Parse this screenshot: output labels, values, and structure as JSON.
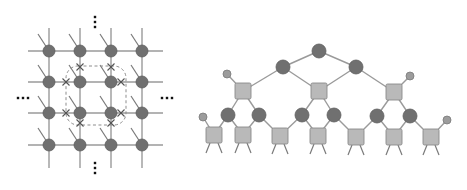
{
  "figure": {
    "width": 467,
    "height": 190,
    "background": "#ffffff"
  },
  "colors": {
    "edge": "#9a9a9a",
    "circle_node": "#707070",
    "small_node": "#9c9c9c",
    "square_node": "#b9b9b9",
    "dashed_loop": "#8d8d8d",
    "cross_marker": "#555555",
    "ellipsis": "#111111"
  },
  "left_panel": {
    "name": "2D tensor network lattice (PEPS)",
    "grid": {
      "columns_x": [
        49,
        80,
        111,
        142
      ],
      "rows_y": [
        51,
        82,
        113,
        145
      ],
      "node_radius": 6,
      "edge_extent": {
        "x_min": 28,
        "x_max": 163,
        "y_min": 28,
        "y_max": 168
      }
    },
    "dashed_loop": {
      "x": 66,
      "y": 66,
      "width": 60,
      "height": 59,
      "radius": 12
    },
    "cross_markers": [
      [
        80,
        67
      ],
      [
        111,
        67
      ],
      [
        66,
        82
      ],
      [
        121,
        82
      ],
      [
        66,
        113
      ],
      [
        121,
        113
      ],
      [
        80,
        123
      ],
      [
        111,
        123
      ]
    ],
    "ellipses": [
      {
        "position": "top",
        "orientation": "vertical",
        "x": 95,
        "y": 22
      },
      {
        "position": "bottom",
        "orientation": "vertical",
        "x": 95,
        "y": 168
      },
      {
        "position": "left",
        "orientation": "horizontal",
        "x": 23,
        "y": 98
      },
      {
        "position": "right",
        "orientation": "horizontal",
        "x": 167,
        "y": 98
      }
    ]
  },
  "right_panel": {
    "name": "Tree tensor network",
    "circles": [
      {
        "id": "root",
        "x": 319,
        "y": 51,
        "r": 7
      },
      {
        "id": "l1a",
        "x": 283,
        "y": 67,
        "r": 7
      },
      {
        "id": "l1b",
        "x": 356,
        "y": 67,
        "r": 7
      },
      {
        "id": "l3a",
        "x": 228,
        "y": 115,
        "r": 7
      },
      {
        "id": "l3b",
        "x": 259,
        "y": 115,
        "r": 7
      },
      {
        "id": "l3c",
        "x": 302,
        "y": 115,
        "r": 7
      },
      {
        "id": "l3d",
        "x": 334,
        "y": 115,
        "r": 7
      },
      {
        "id": "l3e",
        "x": 377,
        "y": 116,
        "r": 7
      },
      {
        "id": "l3f",
        "x": 410,
        "y": 116,
        "r": 7
      }
    ],
    "small_circles": [
      {
        "id": "s1",
        "x": 227,
        "y": 74,
        "r": 4
      },
      {
        "id": "s2",
        "x": 410,
        "y": 76,
        "r": 4
      },
      {
        "id": "s3",
        "x": 203,
        "y": 117,
        "r": 4
      },
      {
        "id": "s4",
        "x": 447,
        "y": 120,
        "r": 4
      }
    ],
    "squares": [
      {
        "id": "q1",
        "x": 243,
        "y": 91,
        "size": 16
      },
      {
        "id": "q2",
        "x": 319,
        "y": 91,
        "size": 16
      },
      {
        "id": "q3",
        "x": 394,
        "y": 92,
        "size": 16
      },
      {
        "id": "b1",
        "x": 214,
        "y": 135,
        "size": 16
      },
      {
        "id": "b2",
        "x": 243,
        "y": 135,
        "size": 16
      },
      {
        "id": "b3",
        "x": 280,
        "y": 136,
        "size": 16
      },
      {
        "id": "b4",
        "x": 318,
        "y": 136,
        "size": 16
      },
      {
        "id": "b5",
        "x": 356,
        "y": 137,
        "size": 16
      },
      {
        "id": "b6",
        "x": 394,
        "y": 137,
        "size": 16
      },
      {
        "id": "b7",
        "x": 431,
        "y": 137,
        "size": 16
      }
    ],
    "edges": [
      [
        "root",
        "l1a"
      ],
      [
        "root",
        "l1b"
      ],
      [
        "l1a",
        "q1"
      ],
      [
        "l1a",
        "q2"
      ],
      [
        "l1b",
        "q2"
      ],
      [
        "l1b",
        "q3"
      ],
      [
        "q1",
        "s1"
      ],
      [
        "q3",
        "s2"
      ],
      [
        "q1",
        "l3a"
      ],
      [
        "q1",
        "l3b"
      ],
      [
        "q2",
        "l3c"
      ],
      [
        "q2",
        "l3d"
      ],
      [
        "q3",
        "l3e"
      ],
      [
        "q3",
        "l3f"
      ],
      [
        "l3a",
        "b1"
      ],
      [
        "l3a",
        "b2"
      ],
      [
        "l3b",
        "b2"
      ],
      [
        "l3b",
        "b3"
      ],
      [
        "l3c",
        "b3"
      ],
      [
        "l3c",
        "b4"
      ],
      [
        "l3d",
        "b4"
      ],
      [
        "l3d",
        "b5"
      ],
      [
        "l3e",
        "b5"
      ],
      [
        "l3e",
        "b6"
      ],
      [
        "l3f",
        "b6"
      ],
      [
        "l3f",
        "b7"
      ],
      [
        "b1",
        "s3"
      ],
      [
        "b7",
        "s4"
      ]
    ],
    "leg_length": 10
  }
}
